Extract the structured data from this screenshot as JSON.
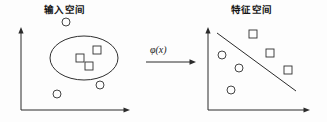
{
  "figure": {
    "name": "kernel-feature-map-diagram",
    "width": 327,
    "height": 122,
    "background_color": "#fdfdfd",
    "ink_color": "#2b2b2b"
  },
  "left_panel": {
    "title": "输入空间",
    "title_translation": "Input Space",
    "axes": {
      "y_axis": {
        "x": 21,
        "y_top": 27,
        "y_bottom": 110,
        "arrow": "up"
      },
      "x_axis": {
        "y": 110,
        "x_left": 21,
        "x_right": 130,
        "arrow": "right"
      }
    },
    "region": {
      "name": "decision-region-ellipse",
      "shape": "ellipse",
      "cx": 84,
      "cy": 58,
      "rx": 34,
      "ry": 22
    },
    "squares": [
      {
        "x": 80,
        "y": 58
      },
      {
        "x": 97,
        "y": 50
      },
      {
        "x": 89,
        "y": 66
      }
    ],
    "circles": [
      {
        "x": 66,
        "y": 22
      },
      {
        "x": 100,
        "y": 85
      },
      {
        "x": 57,
        "y": 94
      }
    ]
  },
  "mapping": {
    "label": "φ(x)",
    "arrow": {
      "x_start": 146,
      "x_end": 196,
      "y": 62,
      "direction": "right"
    }
  },
  "right_panel": {
    "title": "特征空间",
    "title_translation": "Feature Space",
    "axes": {
      "y_axis": {
        "x": 208,
        "y_top": 27,
        "y_bottom": 110,
        "arrow": "up"
      },
      "x_axis": {
        "y": 110,
        "x_left": 208,
        "x_right": 310,
        "arrow": "right"
      }
    },
    "boundary": {
      "name": "linear-separating-line",
      "x1": 217,
      "y1": 33,
      "x2": 296,
      "y2": 91
    },
    "squares": [
      {
        "x": 253,
        "y": 34
      },
      {
        "x": 270,
        "y": 53
      },
      {
        "x": 288,
        "y": 70
      }
    ],
    "circles": [
      {
        "x": 222,
        "y": 55
      },
      {
        "x": 239,
        "y": 68
      },
      {
        "x": 231,
        "y": 90
      }
    ]
  },
  "glyph_style": {
    "square_size": 8,
    "circle_radius": 4
  }
}
